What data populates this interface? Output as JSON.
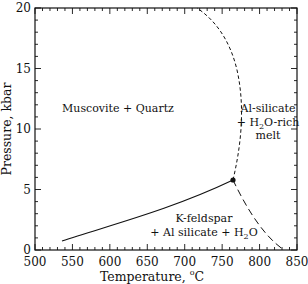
{
  "chart_data": {
    "type": "line",
    "title": "",
    "xlabel": "Temperature, °C",
    "ylabel": "Pressure, kbar",
    "xlim": [
      500,
      850
    ],
    "ylim": [
      0,
      20
    ],
    "xticks": [
      500,
      550,
      600,
      650,
      700,
      750,
      800,
      850
    ],
    "yticks": [
      0,
      5,
      10,
      15,
      20
    ],
    "grid": false,
    "series": [
      {
        "name": "Muscovite + Quartz = K-feldspar + Al silicate + H2O",
        "style": "solid",
        "x": [
          537,
          580,
          620,
          660,
          700,
          730
        ],
        "y": [
          0.75,
          1.7,
          2.6,
          3.6,
          4.7,
          5.8
        ]
      },
      {
        "name": "Muscovite + Quartz = Al-silicate + H2O-rich melt",
        "style": "dashed",
        "x": [
          730,
          748,
          762,
          767,
          762,
          745,
          716
        ],
        "y": [
          5.8,
          8.0,
          11.0,
          14.0,
          16.5,
          18.6,
          20.0
        ]
      },
      {
        "name": "K-feldspar + Al silicate + H2O = Al-silicate + H2O-rich melt",
        "style": "long-dashed",
        "x": [
          730,
          755,
          780,
          805,
          832
        ],
        "y": [
          5.8,
          4.0,
          2.5,
          1.2,
          0.0
        ]
      }
    ],
    "invariant_point": {
      "x": 730,
      "y": 5.8
    },
    "annotations": [
      {
        "text": "Muscovite + Quartz",
        "x": 610,
        "y": 10.8
      },
      {
        "text": "Al-silicate",
        "x": 800,
        "y": 11
      },
      {
        "text": "+ H2O-rich",
        "x": 800,
        "y": 9.8
      },
      {
        "text": "melt",
        "x": 800,
        "y": 8.6
      },
      {
        "text": "K-feldspar",
        "x": 730,
        "y": 2.6
      },
      {
        "text": "+ Al silicate + H2O",
        "x": 730,
        "y": 1.4
      }
    ]
  },
  "labels": {
    "xlabel": "Temperature, ",
    "xlabel_unit": "C",
    "xlabel_degree": "o",
    "ylabel": "Pressure, kbar",
    "region_mq": "Muscovite + Quartz",
    "region_melt_1": "Al-silicate",
    "region_melt_2a": "+ H",
    "region_melt_2sub": "2",
    "region_melt_2b": "O-rich",
    "region_melt_3": "melt",
    "region_kf_1": "K-feldspar",
    "region_kf_2a": "+ Al silicate + H",
    "region_kf_2sub": "2",
    "region_kf_2b": "O"
  },
  "ticks": {
    "x": [
      "500",
      "550",
      "600",
      "650",
      "700",
      "750",
      "800",
      "850"
    ],
    "y": [
      "0",
      "5",
      "10",
      "15",
      "20"
    ]
  }
}
